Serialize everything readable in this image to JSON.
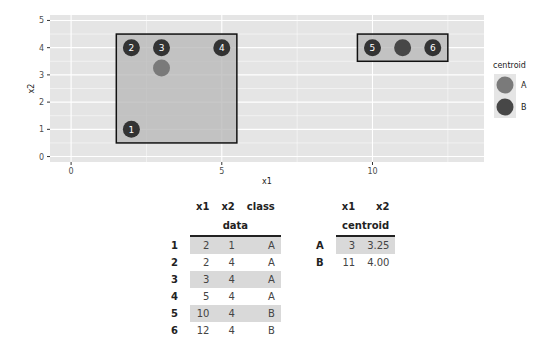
{
  "chart_data": {
    "type": "scatter",
    "title": "",
    "xlabel": "x1",
    "ylabel": "x2",
    "xlim": [
      -0.7,
      13.7
    ],
    "ylim": [
      -0.2,
      5.2
    ],
    "x_ticks": [
      0,
      5,
      10
    ],
    "y_ticks": [
      0,
      1,
      2,
      3,
      4,
      5
    ],
    "grid": true,
    "legend": {
      "title": "centroid",
      "position": "right",
      "entries": [
        {
          "label": "A",
          "color": "#7a7a7a"
        },
        {
          "label": "B",
          "color": "#474747"
        }
      ]
    },
    "points": [
      {
        "id": "1",
        "x1": 2,
        "x2": 1,
        "class": "A"
      },
      {
        "id": "2",
        "x1": 2,
        "x2": 4,
        "class": "A"
      },
      {
        "id": "3",
        "x1": 3,
        "x2": 4,
        "class": "A"
      },
      {
        "id": "4",
        "x1": 5,
        "x2": 4,
        "class": "A"
      },
      {
        "id": "5",
        "x1": 10,
        "x2": 4,
        "class": "B"
      },
      {
        "id": "6",
        "x1": 12,
        "x2": 4,
        "class": "B"
      }
    ],
    "centroids": [
      {
        "label": "A",
        "x1": 3,
        "x2": 3.25,
        "color": "#7a7a7a"
      },
      {
        "label": "B",
        "x1": 11,
        "x2": 4.0,
        "color": "#474747"
      }
    ],
    "boxes": [
      {
        "class": "A",
        "x1min": 1.5,
        "x1max": 5.5,
        "x2min": 0.5,
        "x2max": 4.5
      },
      {
        "class": "B",
        "x1min": 9.5,
        "x1max": 12.5,
        "x2min": 3.5,
        "x2max": 4.5
      }
    ]
  },
  "tables": {
    "data": {
      "title": "data",
      "columns": [
        "x1",
        "x2",
        "class"
      ],
      "rows": [
        {
          "rn": "1",
          "x1": "2",
          "x2": "1",
          "class": "A"
        },
        {
          "rn": "2",
          "x1": "2",
          "x2": "4",
          "class": "A"
        },
        {
          "rn": "3",
          "x1": "3",
          "x2": "4",
          "class": "A"
        },
        {
          "rn": "4",
          "x1": "5",
          "x2": "4",
          "class": "A"
        },
        {
          "rn": "5",
          "x1": "10",
          "x2": "4",
          "class": "B"
        },
        {
          "rn": "6",
          "x1": "12",
          "x2": "4",
          "class": "B"
        }
      ]
    },
    "centroid": {
      "title": "centroid",
      "columns": [
        "x1",
        "x2"
      ],
      "rows": [
        {
          "rn": "A",
          "x1": "3",
          "x2": "3.25"
        },
        {
          "rn": "B",
          "x1": "11",
          "x2": "4.00"
        }
      ]
    }
  }
}
